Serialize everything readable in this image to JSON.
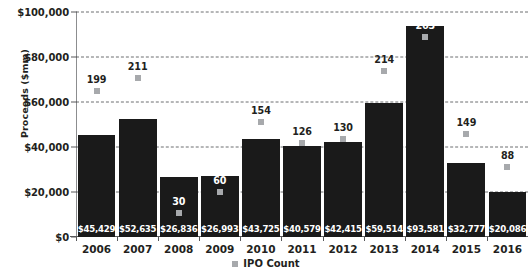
{
  "chart_data": {
    "type": "bar",
    "title": "",
    "xlabel": "",
    "ylabel": "Proceeds ($mm)",
    "categories": [
      "2006",
      "2007",
      "2008",
      "2009",
      "2010",
      "2011",
      "2012",
      "2013",
      "2014",
      "2015",
      "2016"
    ],
    "ylim": [
      0,
      100000
    ],
    "yticks": [
      0,
      20000,
      40000,
      60000,
      80000,
      100000
    ],
    "ytick_labels": [
      "$0",
      "$20,000",
      "$40,000",
      "$60,000",
      "$80,000",
      "$100,000"
    ],
    "grid": true,
    "legend_position": "bottom-center",
    "series": [
      {
        "name": "Proceeds ($mm)",
        "type": "bar",
        "color": "#1a1a1a",
        "values": [
          45429,
          52635,
          26836,
          26993,
          43725,
          40579,
          42415,
          59514,
          93581,
          32777,
          20086
        ],
        "data_labels": [
          "$45,429",
          "$52,635",
          "$26,836",
          "$26,993",
          "$43,725",
          "$40,579",
          "$42,415",
          "$59,514",
          "$93,581",
          "$32,777",
          "$20,086"
        ]
      },
      {
        "name": "IPO Count",
        "type": "scatter",
        "color": "#a7a9ac",
        "values": [
          199,
          211,
          30,
          60,
          154,
          126,
          130,
          214,
          263,
          149,
          88
        ],
        "data_labels": [
          "199",
          "211",
          "30",
          "60",
          "154",
          "126",
          "130",
          "214",
          "263",
          "149",
          "88"
        ],
        "marker_y_proceeds": [
          65000,
          70500,
          10500,
          20000,
          51000,
          42000,
          43500,
          74000,
          89000,
          46000,
          31000
        ]
      }
    ]
  },
  "legend": {
    "items": [
      {
        "label": "IPO Count",
        "color": "#a7a9ac"
      }
    ]
  }
}
